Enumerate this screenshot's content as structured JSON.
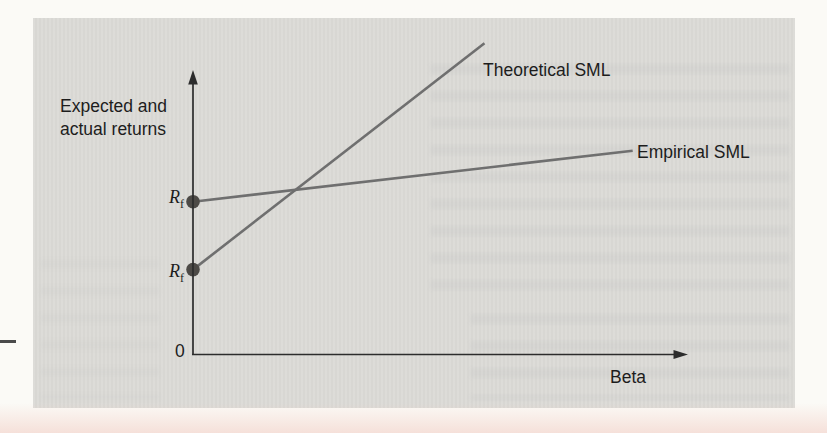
{
  "figure": {
    "y_axis_label": [
      "Expected and",
      "actual returns"
    ],
    "x_axis_label": "Beta",
    "origin_label": "0",
    "risk_free_symbol": "R",
    "risk_free_subscript": "f",
    "line_labels": {
      "theoretical": "Theoretical SML",
      "empirical": "Empirical SML"
    },
    "colors": {
      "panel_bg": "#dbdad6",
      "page_bg": "#fbfaf6",
      "bottom_tint": "#f1cbc2",
      "axis": "#2c2c2c",
      "sml_line": "#6f6f6f",
      "point": "#4d4a46",
      "text": "#1d1d1d"
    }
  },
  "chart_data": {
    "type": "line",
    "title": "",
    "xlabel": "Beta",
    "ylabel": "Expected and actual returns",
    "axes_numeric": false,
    "grid": false,
    "legend_position": "inline-labels",
    "series": [
      {
        "name": "Theoretical SML",
        "points": [
          [
            0,
            0.3
          ],
          [
            0.59,
            1.1
          ]
        ],
        "intercept_point_label": "Rf"
      },
      {
        "name": "Empirical SML",
        "points": [
          [
            0,
            0.54
          ],
          [
            0.89,
            0.72
          ]
        ],
        "intercept_point_label": "Rf"
      }
    ]
  }
}
